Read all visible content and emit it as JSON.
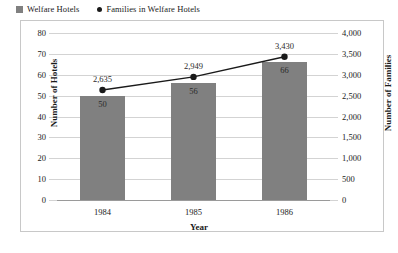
{
  "legend": {
    "items": [
      {
        "label": "Welfare Hotels",
        "marker": "square-swatch-icon",
        "color": "#808080"
      },
      {
        "label": "Families in Welfare Hotels",
        "marker": "dot-marker-icon",
        "color": "#1a1a1a"
      }
    ]
  },
  "axis_titles": {
    "left": "Number of Hotels",
    "right": "Number of Families",
    "bottom": "Year"
  },
  "chart_data": {
    "type": "bar",
    "title": "",
    "categories": [
      "1984",
      "1985",
      "1986"
    ],
    "xlabel": "Year",
    "ylabel": "Number of Hotels",
    "y2label": "Number of Families",
    "ylim": [
      0,
      80
    ],
    "y2lim": [
      0,
      4000
    ],
    "yticks": [
      "0",
      "10",
      "20",
      "30",
      "40",
      "50",
      "60",
      "70",
      "80"
    ],
    "ytick_values": [
      0,
      10,
      20,
      30,
      40,
      50,
      60,
      70,
      80
    ],
    "y2ticks": [
      "0",
      "500",
      "1,000",
      "1,500",
      "2,000",
      "2,500",
      "3,000",
      "3,500",
      "4,000"
    ],
    "y2tick_values": [
      0,
      500,
      1000,
      1500,
      2000,
      2500,
      3000,
      3500,
      4000
    ],
    "grid": true,
    "legend_position": "top-left",
    "series": [
      {
        "name": "Welfare Hotels",
        "type": "bar",
        "axis": "left",
        "color": "#808080",
        "values": [
          50,
          56,
          66
        ],
        "labels": [
          "50",
          "56",
          "66"
        ]
      },
      {
        "name": "Families in Welfare Hotels",
        "type": "line",
        "axis": "right",
        "color": "#1a1a1a",
        "values": [
          2635,
          2949,
          3430
        ],
        "labels": [
          "2,635",
          "2,949",
          "3,430"
        ]
      }
    ]
  }
}
